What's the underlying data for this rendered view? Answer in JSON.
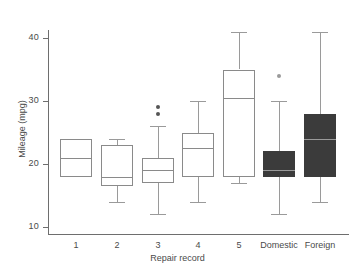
{
  "chart_data": {
    "type": "box",
    "title": "",
    "xlabel": "Repair record",
    "ylabel": "Mileage (mpg)",
    "ylim": [
      9,
      42
    ],
    "yticks": [
      10,
      20,
      30,
      40
    ],
    "ytick_labels": [
      "10",
      "20",
      "30",
      "40"
    ],
    "grid": false,
    "legend": "none",
    "categories": [
      "1",
      "2",
      "3",
      "4",
      "5",
      "Domestic",
      "Foreign"
    ],
    "boxes": [
      {
        "category": "1",
        "whisker_low": 18,
        "q1": 18,
        "median": 21,
        "q3": 24,
        "whisker_high": 24,
        "outliers": [],
        "fill": "none"
      },
      {
        "category": "2",
        "whisker_low": 14,
        "q1": 16.5,
        "median": 18,
        "q3": 23,
        "whisker_high": 24,
        "outliers": [],
        "fill": "none"
      },
      {
        "category": "3",
        "whisker_low": 12,
        "q1": 17,
        "median": 19,
        "q3": 21,
        "whisker_high": 26,
        "outliers": [
          28,
          29
        ],
        "fill": "none"
      },
      {
        "category": "4",
        "whisker_low": 14,
        "q1": 18,
        "median": 22.5,
        "q3": 25,
        "whisker_high": 30,
        "outliers": [],
        "fill": "none"
      },
      {
        "category": "5",
        "whisker_low": 17,
        "q1": 18,
        "median": 30.5,
        "q3": 35,
        "whisker_high": 41,
        "outliers": [],
        "fill": "none"
      },
      {
        "category": "Domestic",
        "whisker_low": 12,
        "q1": 18,
        "median": 19,
        "q3": 22,
        "whisker_high": 30,
        "outliers": [
          34
        ],
        "fill": "solid"
      },
      {
        "category": "Foreign",
        "whisker_low": 14,
        "q1": 18,
        "median": 24,
        "q3": 28,
        "whisker_high": 41,
        "outliers": [],
        "fill": "solid"
      }
    ],
    "colors": {
      "axis": "#6e6e6e",
      "box_outline": "#8a8a8a",
      "box_fill": "#3b3b3b",
      "whisker": "#9a9a9a",
      "outlier": "#555555",
      "text": "#4a4a4a",
      "background": "#ffffff"
    }
  }
}
